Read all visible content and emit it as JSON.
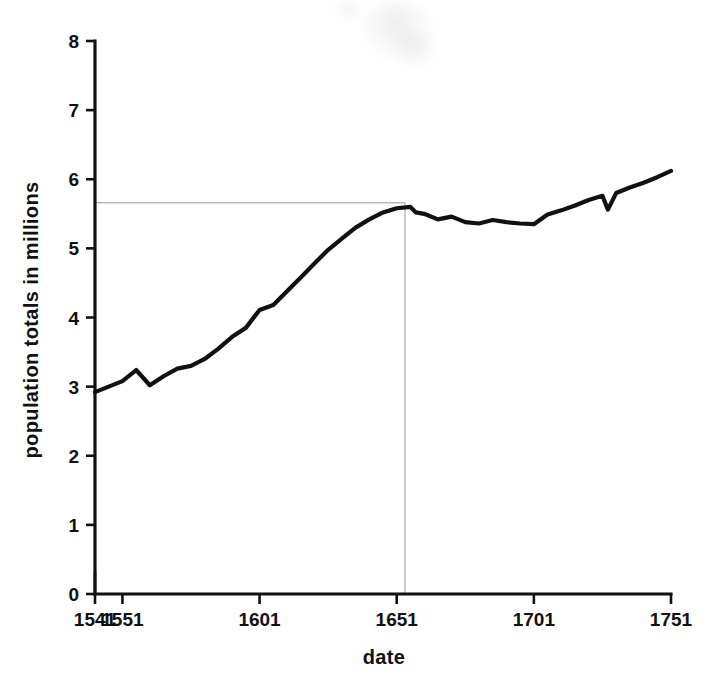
{
  "chart_data": {
    "type": "line",
    "title": "",
    "xlabel": "date",
    "ylabel": "population totals in millions",
    "xlim": [
      1541,
      1751
    ],
    "ylim": [
      0,
      8
    ],
    "grid": false,
    "legend": null,
    "xticks": [
      1541,
      1551,
      1601,
      1651,
      1701,
      1751
    ],
    "xtick_labels": [
      "1541",
      "1551",
      "1601",
      "1651",
      "1701",
      "1751"
    ],
    "yticks": [
      0,
      1,
      2,
      3,
      4,
      5,
      6,
      7,
      8
    ],
    "ytick_labels": [
      "0",
      "1",
      "2",
      "3",
      "4",
      "5",
      "6",
      "7",
      "8"
    ],
    "series": [
      {
        "name": "population totals",
        "units": "millions",
        "x": [
          1541,
          1546,
          1551,
          1556,
          1561,
          1566,
          1571,
          1576,
          1581,
          1586,
          1591,
          1596,
          1601,
          1606,
          1611,
          1616,
          1621,
          1626,
          1631,
          1636,
          1641,
          1646,
          1651,
          1656,
          1658,
          1661,
          1666,
          1671,
          1676,
          1681,
          1686,
          1691,
          1696,
          1701,
          1706,
          1711,
          1716,
          1721,
          1726,
          1728,
          1731,
          1736,
          1741,
          1746,
          1751
        ],
        "values": [
          2.92,
          3.0,
          3.08,
          3.24,
          3.02,
          3.15,
          3.26,
          3.3,
          3.4,
          3.55,
          3.72,
          3.85,
          4.11,
          4.18,
          4.38,
          4.58,
          4.78,
          4.98,
          5.14,
          5.3,
          5.42,
          5.52,
          5.58,
          5.6,
          5.52,
          5.5,
          5.42,
          5.46,
          5.38,
          5.36,
          5.41,
          5.38,
          5.36,
          5.35,
          5.49,
          5.55,
          5.62,
          5.7,
          5.76,
          5.56,
          5.8,
          5.88,
          5.95,
          6.03,
          6.12
        ]
      }
    ],
    "annotations": [
      {
        "name": "peak-horizontal-guide",
        "type": "horizontal-line",
        "y": 5.66,
        "x_start": 1541,
        "x_end": 1654,
        "style": "faint-pencil",
        "color": "#b9b9b9"
      },
      {
        "name": "peak-vertical-guide",
        "type": "vertical-line",
        "x": 1654,
        "y_start": 0,
        "y_end": 5.66,
        "style": "faint-pencil",
        "color": "#b9b9b9"
      }
    ],
    "colors": {
      "series": "#111111",
      "axis": "#111111",
      "guide": "#b9b9b9",
      "background": "#ffffff"
    }
  }
}
